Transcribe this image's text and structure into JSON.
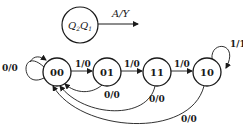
{
  "legend": {
    "state_label": "Q",
    "state_sub1": "2",
    "state_label2": "Q",
    "state_sub2": "1",
    "transition_label": "A/Y"
  },
  "states": [
    {
      "id": "s00",
      "label": "00"
    },
    {
      "id": "s01",
      "label": "01"
    },
    {
      "id": "s11",
      "label": "11"
    },
    {
      "id": "s10",
      "label": "10"
    }
  ],
  "transitions": [
    {
      "from": "00",
      "to": "00",
      "label": "0/0"
    },
    {
      "from": "00",
      "to": "01",
      "label": "1/0"
    },
    {
      "from": "01",
      "to": "11",
      "label": "1/0"
    },
    {
      "from": "11",
      "to": "10",
      "label": "1/0"
    },
    {
      "from": "10",
      "to": "10",
      "label": "1/1"
    },
    {
      "from": "01",
      "to": "00",
      "label": "0/0"
    },
    {
      "from": "11",
      "to": "00",
      "label": "0/0"
    },
    {
      "from": "10",
      "to": "00",
      "label": "0/0"
    }
  ],
  "colors": {
    "stroke": "#1a1a1a",
    "background": "#ffffff"
  }
}
